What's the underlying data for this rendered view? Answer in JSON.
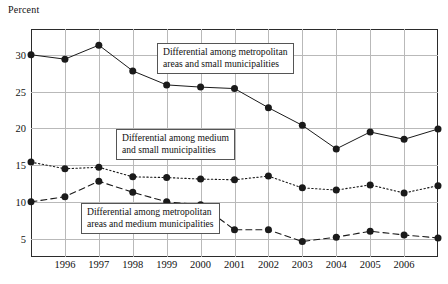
{
  "chart_data": {
    "type": "line",
    "title": "",
    "ylabel": "Percent",
    "xlabel": "",
    "ylim": [
      2.5,
      33.5
    ],
    "yticks": [
      5,
      10,
      15,
      20,
      25,
      30
    ],
    "ytick_labels": [
      "5",
      "10",
      "15",
      "20",
      "25",
      "30"
    ],
    "x": [
      1995,
      1996,
      1997,
      1998,
      1999,
      2000,
      2001,
      2002,
      2003,
      2004,
      2005,
      2006,
      2007
    ],
    "xtick_labels": [
      "1996",
      "1997",
      "1998",
      "1999",
      "2000",
      "2001",
      "2002",
      "2003",
      "2004",
      "2005",
      "2006"
    ],
    "xticks": [
      1996,
      1997,
      1998,
      1999,
      2000,
      2001,
      2002,
      2003,
      2004,
      2005,
      2006
    ],
    "grid": true,
    "legend_position": "inline-annotations",
    "series": [
      {
        "name": "Differential among metropolitan areas and small municipalities",
        "style": "solid",
        "marker": "filled-circle",
        "color": "#1a1a1a",
        "values": [
          30.0,
          29.4,
          31.3,
          27.8,
          25.9,
          25.6,
          25.4,
          22.8,
          20.4,
          17.2,
          19.5,
          18.5,
          19.9
        ]
      },
      {
        "name": "Differential among medium and small municipalities",
        "style": "dotted",
        "marker": "filled-circle",
        "color": "#1a1a1a",
        "values": [
          15.4,
          14.5,
          14.7,
          13.4,
          13.3,
          13.1,
          13.0,
          13.5,
          11.9,
          11.6,
          12.3,
          11.2,
          12.2
        ]
      },
      {
        "name": "Differential among metropolitan areas and medium municipalities",
        "style": "dashed",
        "marker": "filled-circle",
        "color": "#1a1a1a",
        "values": [
          10.0,
          10.7,
          12.8,
          11.3,
          10.0,
          9.6,
          6.2,
          6.2,
          4.6,
          5.2,
          6.0,
          5.5,
          5.1
        ]
      }
    ],
    "annotations": [
      {
        "id": "ann-top",
        "line1": "Differential among metropolitan",
        "line2": "areas and small municipalities"
      },
      {
        "id": "ann-middle",
        "line1": "Differential among medium",
        "line2": "and small municipalities"
      },
      {
        "id": "ann-bottom",
        "line1": "Differential among metropolitan",
        "line2": "areas and medium municipalities"
      }
    ]
  }
}
